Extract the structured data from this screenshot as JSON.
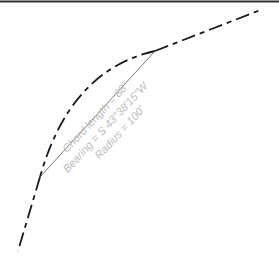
{
  "diagram": {
    "labels": {
      "chord_length": "Chord length = 88'",
      "bearing": "Bearing = S 43°38'15\"W",
      "radius": "Radius = 100'"
    },
    "colors": {
      "lines": "#1a1a1a",
      "chord": "#555555",
      "label": "#bdbdbd",
      "border": "#333333"
    },
    "elements": [
      "top-border-line",
      "upper-tangent-dashed",
      "curve-arc-dashed",
      "lower-tangent-dashed",
      "chord-line",
      "annotation-text"
    ]
  }
}
